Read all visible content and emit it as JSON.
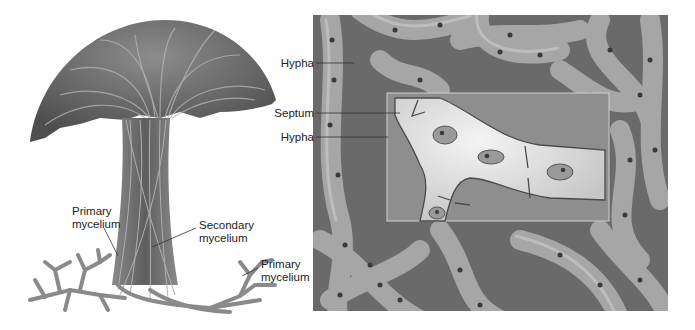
{
  "figure": {
    "left_panel": {
      "subject": "mushroom fruiting body made of hyphae",
      "labels": [
        {
          "id": "primary-mycelium-left",
          "text_line1": "Primary",
          "text_line2": "mycelium"
        },
        {
          "id": "secondary-mycelium",
          "text_line1": "Secondary",
          "text_line2": "mycelium"
        },
        {
          "id": "primary-mycelium-right",
          "text_line1": "Primary",
          "text_line2": "mycelium"
        }
      ]
    },
    "right_panel": {
      "subject": "tangled septate hyphae with magnified inset",
      "labels": [
        {
          "id": "hypha-top",
          "text": "Hypha"
        },
        {
          "id": "septum",
          "text": "Septum"
        },
        {
          "id": "hypha-bottom",
          "text": "Hypha"
        }
      ]
    },
    "colors": {
      "background": "#ffffff",
      "cap_dark": "#5a5a5a",
      "cap_light": "#9a9a9a",
      "hypha_fill": "#a8a8a8",
      "hypha_dark": "#6e6e6e",
      "inset_cell": "#dcdcdc",
      "nucleus": "#3a3a3a",
      "label_text": "#222222",
      "leader_line": "#333333"
    }
  }
}
